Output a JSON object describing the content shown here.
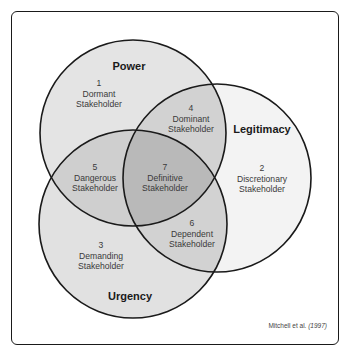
{
  "circles": {
    "power": {
      "title": "Power"
    },
    "legitimacy": {
      "title": "Legitimacy"
    },
    "urgency": {
      "title": "Urgency"
    }
  },
  "regions": [
    {
      "number": "1",
      "name": "Dormant",
      "suffix": "Stakeholder"
    },
    {
      "number": "2",
      "name": "Discretionary",
      "suffix": "Stakeholder"
    },
    {
      "number": "3",
      "name": "Demanding",
      "suffix": "Stakeholder"
    },
    {
      "number": "4",
      "name": "Dominant",
      "suffix": "Stakeholder"
    },
    {
      "number": "5",
      "name": "Dangerous",
      "suffix": "Stakeholder"
    },
    {
      "number": "6",
      "name": "Dependent",
      "suffix": "Stakeholder"
    },
    {
      "number": "7",
      "name": "Definitive",
      "suffix": "Stakeholder"
    }
  ],
  "citation": {
    "author": "Mitchell",
    "etal": "et al.",
    "year": "(1997)"
  },
  "colors": {
    "power_fill": "#e4e4e4",
    "legitimacy_fill": "#f3f3f3",
    "urgency_fill": "#e1e1e1",
    "overlap_fill": "#cdcdcd",
    "center_fill": "#b9b9b9",
    "stroke": "#1a1a1a"
  }
}
